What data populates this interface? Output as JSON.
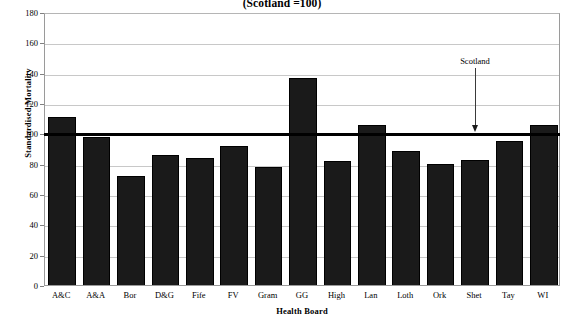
{
  "chart_data": {
    "type": "bar",
    "title": "(Scotland =100)",
    "xlabel": "Health Board",
    "ylabel": "Standardised Mortality",
    "ylim": [
      0,
      180
    ],
    "yticks": [
      0,
      20,
      40,
      60,
      80,
      100,
      120,
      140,
      160,
      180
    ],
    "grid": true,
    "legend": "none",
    "categories": [
      "A&C",
      "A&A",
      "Bor",
      "D&G",
      "Fife",
      "FV",
      "Gram",
      "GG",
      "High",
      "Lan",
      "Loth",
      "Ork",
      "Shet",
      "Tay",
      "WI"
    ],
    "values": [
      112,
      99,
      73,
      87,
      85,
      93,
      79,
      138,
      83,
      107,
      90,
      81,
      84,
      96,
      107
    ],
    "reference_line": {
      "label": "Scotland",
      "value": 100
    },
    "bar_color": "#1a1a1a",
    "gridline_color": "#c8c8c8",
    "reference_line_color": "#000000"
  },
  "axis": {
    "y_tick_labels": [
      "180",
      "160",
      "140",
      "120",
      "100",
      "80",
      "60",
      "40",
      "20",
      "0"
    ]
  }
}
